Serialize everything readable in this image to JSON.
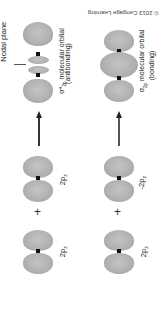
{
  "figure": {
    "copyright": "© 2013 Cengage Learning",
    "orientation": "rotated 180 degrees",
    "lobe_color": "#b2b2b2",
    "nucleus_color": "#111111"
  },
  "antibonding_row": {
    "orbital_a_label": "2p",
    "orbital_a_sub": "z",
    "orbital_b_label": "2p",
    "orbital_b_sub": "z",
    "operator": "+",
    "result_symbol": "σ*",
    "result_sub": "2p",
    "result_label": "molecular orbital",
    "result_kind": "(antibonding)",
    "nodal_plane_label": "Nodal plane"
  },
  "bonding_row": {
    "orbital_a_label": "2p",
    "orbital_a_sub": "z",
    "orbital_b_label": "-2p",
    "orbital_b_sub": "z",
    "operator": "+",
    "result_symbol": "σ",
    "result_sub": "2p",
    "result_label": "molecular orbital",
    "result_kind": "(bonding)"
  }
}
